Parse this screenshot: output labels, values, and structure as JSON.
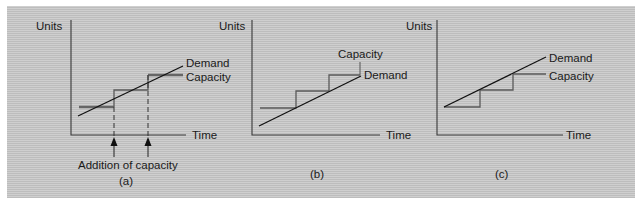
{
  "figure": {
    "panels": [
      {
        "id": "a",
        "caption": "(a)",
        "y_axis_label": "Units",
        "x_axis_label": "Time",
        "demand_label": "Demand",
        "capacity_label": "Capacity",
        "annotation": "Addition of capacity",
        "strategy": "capacity leads/lags around demand (intermediate)"
      },
      {
        "id": "b",
        "caption": "(b)",
        "y_axis_label": "Units",
        "x_axis_label": "Time",
        "demand_label": "Demand",
        "capacity_label": "Capacity",
        "strategy": "capacity leads demand"
      },
      {
        "id": "c",
        "caption": "(c)",
        "y_axis_label": "Units",
        "x_axis_label": "Time",
        "demand_label": "Demand",
        "capacity_label": "Capacity",
        "strategy": "capacity lags demand"
      }
    ],
    "colors": {
      "background": "#c9c9c9",
      "demand_line": "#111111",
      "capacity_line": "#5a5a5a"
    }
  }
}
